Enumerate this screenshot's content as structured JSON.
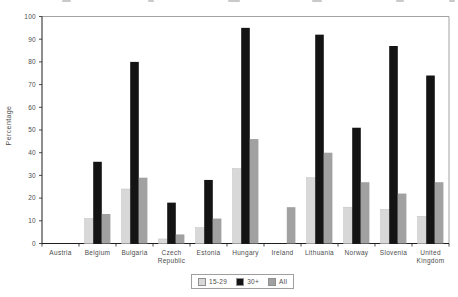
{
  "chart_data": {
    "type": "bar",
    "title": "",
    "xlabel": "",
    "ylabel": "Percentage",
    "ylim": [
      0,
      100
    ],
    "ytick_step": 10,
    "grid": false,
    "legend_position": "bottom-center",
    "categories": [
      "Austria",
      "Belgium",
      "Bulgaria",
      "Czech Republic",
      "Estonia",
      "Hungary",
      "Ireland",
      "Lithuania",
      "Norway",
      "Slovenia",
      "United Kingdom"
    ],
    "series": [
      {
        "name": "15-29",
        "color": "#d8d8d8",
        "values": [
          null,
          11,
          24,
          2,
          7,
          33,
          null,
          29,
          16,
          15,
          12
        ]
      },
      {
        "name": "30+",
        "color": "#141414",
        "values": [
          null,
          36,
          80,
          18,
          28,
          95,
          null,
          92,
          51,
          87,
          74
        ]
      },
      {
        "name": "All",
        "color": "#a1a1a1",
        "values": [
          null,
          13,
          29,
          4,
          11,
          46,
          16,
          40,
          27,
          22,
          27
        ]
      }
    ],
    "ytick_labels": [
      "0",
      "10",
      "20",
      "30",
      "40",
      "50",
      "60",
      "70",
      "80",
      "90",
      "100"
    ],
    "frame_color": "#8c8c8c",
    "axis_color": "#1f1f1f",
    "text_color": "#4d4d4d"
  }
}
